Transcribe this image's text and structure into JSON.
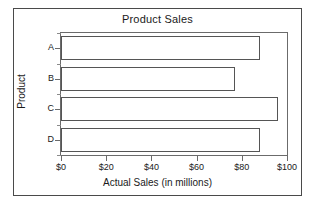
{
  "chart_data": {
    "type": "bar",
    "orientation": "horizontal",
    "title": "Product Sales",
    "xlabel": "Actual Sales (in millions)",
    "ylabel": "Product",
    "categories": [
      "A",
      "B",
      "C",
      "D"
    ],
    "values": [
      88,
      77,
      96,
      88
    ],
    "xlim": [
      0,
      100
    ],
    "xticks": [
      0,
      20,
      40,
      60,
      80,
      100
    ],
    "xticklabels": [
      "$0",
      "$20",
      "$40",
      "$60",
      "$80",
      "$100"
    ],
    "grid": false,
    "legend": false,
    "bar_face_color": "#ffffff",
    "bar_edge_color": "#555555",
    "frame_color": "#6b6b6b",
    "border_color": "#4a4a4a",
    "text_color": "#1a1a1a"
  }
}
